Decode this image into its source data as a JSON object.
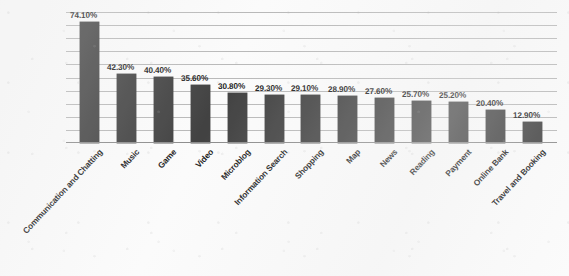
{
  "chart_data": {
    "type": "bar",
    "title": "",
    "subtitle": "",
    "xlabel": "",
    "ylabel": "",
    "ylim": [
      0,
      80
    ],
    "grid": true,
    "gridline_count": 10,
    "legend": "none",
    "bar_color": "#424242",
    "gridline_color": "#b9b9b9",
    "axis_color": "#8d8d8d",
    "background_color": "#fbfbfb",
    "label_suffix": "%",
    "categories": [
      "Communication and Chatting",
      "Music",
      "Game",
      "Video",
      "Microblog",
      "Information Search",
      "Shopping",
      "Map",
      "News",
      "Reading",
      "Payment",
      "Online Bank",
      "Travel and Booking"
    ],
    "values": [
      74.1,
      42.3,
      40.4,
      35.6,
      30.8,
      29.3,
      29.1,
      28.9,
      27.6,
      25.7,
      25.2,
      20.4,
      12.9
    ],
    "value_labels": [
      "74.10%",
      "42.30%",
      "40.40%",
      "35.60%",
      "30.80%",
      "29.30%",
      "29.10%",
      "28.90%",
      "27.60%",
      "25.70%",
      "25.20%",
      "20.40%",
      "12.90%"
    ]
  }
}
